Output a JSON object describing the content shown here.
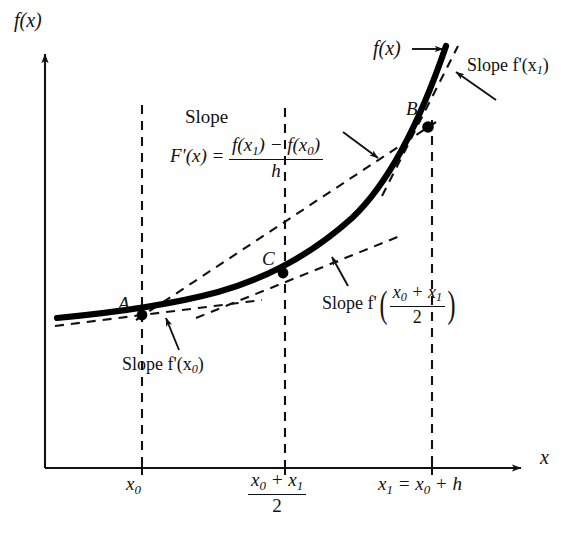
{
  "figure": {
    "axes": {
      "y_label": "f(x)",
      "x_label": "x",
      "origin_px": [
        45,
        468
      ],
      "x_axis_end_px": [
        527,
        468
      ],
      "y_axis_top_px": [
        45,
        48
      ]
    },
    "curve_label": "f(x)",
    "points": [
      {
        "name": "A",
        "label": "A",
        "px": [
          142,
          315
        ]
      },
      {
        "name": "C",
        "label": "C",
        "px": [
          283,
          273
        ]
      },
      {
        "name": "B",
        "label": "B",
        "px": [
          428,
          127
        ]
      }
    ],
    "annotations": {
      "slope_word": "Slope",
      "secant_lhs": "F'(x) =",
      "secant_numerator_left": "f(x",
      "secant_numerator_sub_left": "1",
      "secant_numerator_minus": ") − f(x",
      "secant_numerator_sub_right": "0",
      "secant_numerator_close": ")",
      "secant_denominator": "h",
      "slope_at_x0": "Slope f'(x",
      "slope_at_x0_sub": "0",
      "slope_at_x0_close": ")",
      "slope_at_x1": "Slope f'(x",
      "slope_at_x1_sub": "1",
      "slope_at_x1_close": ")",
      "slope_at_mid_prefix": "Slope f'",
      "slope_at_mid_num_a": "x",
      "slope_at_mid_num_a_sub": "0",
      "slope_at_mid_num_plus": " + x",
      "slope_at_mid_num_b_sub": "1",
      "slope_at_mid_den": "2"
    },
    "x_ticks": [
      {
        "name": "x0",
        "px": 142,
        "text_main": "x",
        "text_sub": "0"
      },
      {
        "name": "mid",
        "px": 285,
        "num_a": "x",
        "num_a_sub": "0",
        "num_plus": " + x",
        "num_b_sub": "1",
        "den": "2"
      },
      {
        "name": "x1",
        "px": 432,
        "text": "x₁ = x₀ + h"
      }
    ],
    "tick_label_x1_parts": {
      "a": "x",
      "a_sub": "1",
      "eq": " = x",
      "b_sub": "0",
      "tail": " + h"
    },
    "colors": {
      "ink": "#111111",
      "curve": "#000000",
      "dashed": "#111111",
      "background": "#ffffff"
    },
    "style": {
      "curve_stroke_width_px": 6,
      "dash_pattern": "9 7",
      "axis_stroke_width_px": 2
    }
  }
}
